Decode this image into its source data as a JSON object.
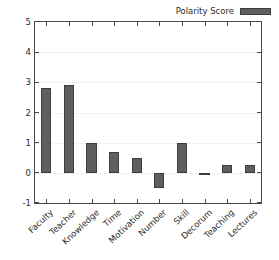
{
  "chart_data": {
    "type": "bar",
    "title": "",
    "xlabel": "",
    "ylabel": "",
    "categories": [
      "Faculty",
      "Teacher",
      "Knowledge",
      "Time",
      "Motivation",
      "Number",
      "Skill",
      "Decorum",
      "Teaching",
      "Lectures"
    ],
    "values": [
      2.8,
      2.9,
      1.0,
      0.7,
      0.5,
      -0.5,
      1.0,
      -0.05,
      0.27,
      0.27
    ],
    "series": [
      {
        "name": "Polarity Score",
        "values": [
          2.8,
          2.9,
          1.0,
          0.7,
          0.5,
          -0.5,
          1.0,
          -0.05,
          0.27,
          0.27
        ]
      }
    ],
    "ylim": [
      -1,
      5
    ],
    "yticks": [
      5,
      4,
      3,
      2,
      1,
      0,
      -1
    ],
    "ytick_labels": [
      "5",
      "4",
      "3",
      "2",
      "1",
      "0",
      "-1"
    ],
    "grid": true,
    "grid_axis": "y",
    "legend": {
      "position": "upper-right",
      "entries": [
        {
          "label": "Polarity Score",
          "color": "#5e5e5e"
        }
      ]
    },
    "colors": {
      "bar_fill": "#5e5e5e",
      "bar_edge": "#3d3d3d",
      "axis": "#4a4a4a",
      "grid": "#e2e2e2",
      "text": "#2b2b2b",
      "background": "#ffffff"
    }
  }
}
